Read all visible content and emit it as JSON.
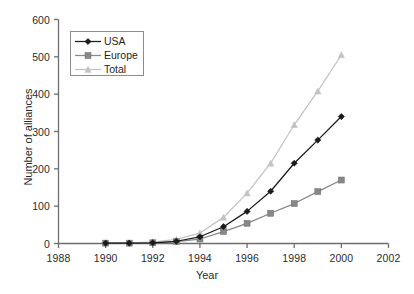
{
  "chart_data": {
    "type": "line",
    "title": "",
    "xlabel": "Year",
    "ylabel": "Number of alliances",
    "xlim": [
      1988,
      2002
    ],
    "ylim": [
      0,
      600
    ],
    "xticks": [
      1988,
      1990,
      1992,
      1994,
      1996,
      1998,
      2000,
      2002
    ],
    "yticks": [
      0,
      100,
      200,
      300,
      400,
      500,
      600
    ],
    "grid": false,
    "legend_position": "upper left",
    "x": [
      1990,
      1991,
      1992,
      1993,
      1994,
      1995,
      1996,
      1997,
      1998,
      1999,
      2000
    ],
    "series": [
      {
        "name": "USA",
        "marker": "diamond",
        "color": "#1a1a1a",
        "values": [
          1,
          1,
          2,
          6,
          18,
          45,
          86,
          140,
          215,
          277,
          340
        ]
      },
      {
        "name": "Europe",
        "marker": "square",
        "color": "#878787",
        "values": [
          1,
          1,
          2,
          5,
          12,
          32,
          54,
          81,
          107,
          139,
          170
        ]
      },
      {
        "name": "Total",
        "marker": "triangle",
        "color": "#c2c2c2",
        "values": [
          2,
          2,
          4,
          11,
          28,
          70,
          135,
          215,
          318,
          408,
          505
        ]
      }
    ]
  },
  "axes": {
    "y_tick_labels": [
      "600",
      "500",
      "400",
      "300",
      "200",
      "100",
      "0"
    ],
    "x_tick_labels": [
      "1988",
      "1990",
      "1992",
      "1994",
      "1996",
      "1998",
      "2000",
      "2002"
    ],
    "y_axis_title": "Number of alliances",
    "x_axis_title": "Year"
  },
  "legend": {
    "items": [
      {
        "label": "USA",
        "color": "#1a1a1a",
        "marker": "diamond"
      },
      {
        "label": "Europe",
        "color": "#878787",
        "marker": "square"
      },
      {
        "label": "Total",
        "color": "#c2c2c2",
        "marker": "triangle"
      }
    ]
  },
  "colors": {
    "usa": "#1a1a1a",
    "europe": "#878787",
    "total": "#c2c2c2",
    "axis": "#6e6e6e",
    "text": "#2b2b2b",
    "background": "#ffffff"
  }
}
